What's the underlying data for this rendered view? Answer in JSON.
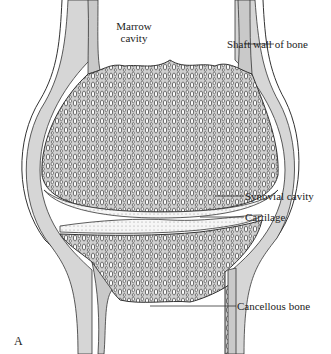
{
  "figure": {
    "panel_letter": "A",
    "colors": {
      "bone_fill": "#c9c9c9",
      "synovial_fill": "#d6d6d6",
      "outline": "#333333",
      "cartilage_fill": "#f4f4f4",
      "background": "#ffffff"
    },
    "labels": {
      "marrow_line1": "Marrow",
      "marrow_line2": "cavity",
      "shaft_wall": "Shaft wall of bone",
      "synovial_cavity": "Synovial cavity",
      "cartilage": "Cartilage",
      "cancellous_bone": "Cancellous bone"
    }
  }
}
